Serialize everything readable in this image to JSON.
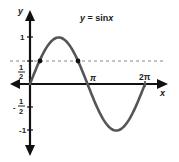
{
  "chart_data": {
    "type": "line",
    "title_parts": {
      "prefix": "y = sin",
      "var": "x"
    },
    "xlabel": "x",
    "ylabel": "y",
    "series": [
      {
        "name": "y = sin x",
        "function": "sin(x)",
        "x_range": [
          0,
          6.2832
        ],
        "color": "#555555"
      }
    ],
    "x_ticks": [
      {
        "value": 3.14159,
        "label": "π"
      },
      {
        "value": 6.28318,
        "label": "2π"
      }
    ],
    "y_ticks": [
      {
        "value": 1,
        "label": "1"
      },
      {
        "value": 0.5,
        "label": "1/2"
      },
      {
        "value": -0.5,
        "label": "-1/2"
      },
      {
        "value": -1,
        "label": "-1"
      }
    ],
    "reference_lines": [
      {
        "type": "horizontal",
        "y": 0.5,
        "style": "dashed"
      }
    ],
    "marked_points": [
      {
        "x": 0.5236,
        "y": 0.5
      },
      {
        "x": 2.618,
        "y": 0.5
      }
    ],
    "ylim": [
      -1.5,
      1.6
    ],
    "grid": false,
    "legend": "none"
  },
  "labels": {
    "title_prefix": "y = sin",
    "title_var": "x",
    "x_axis": "x",
    "y_axis": "y",
    "pi": "π",
    "two_pi": "2π",
    "one": "1",
    "neg_one": "-1",
    "half_num": "1",
    "half_den": "2",
    "neg_sign": "-"
  }
}
